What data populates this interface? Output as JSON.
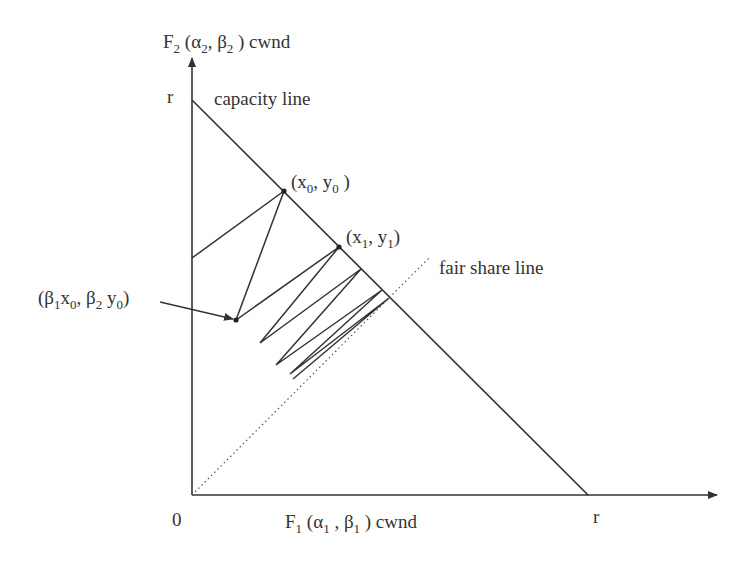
{
  "diagram": {
    "axes": {
      "y_label": {
        "F": "F",
        "f_sub": "2",
        "open": " (",
        "alpha": "α",
        "a_sub": "2",
        "comma": ", ",
        "beta": "β",
        "b_sub": "2",
        "close": " ) cwnd"
      },
      "x_label": {
        "F": "F",
        "f_sub": "1",
        "open": " (",
        "alpha": "α",
        "a_sub": "1",
        "comma": " , ",
        "beta": "β",
        "b_sub": "1",
        "close": " ) cwnd"
      },
      "origin_label": "0",
      "y_max_label": "r",
      "x_max_label": "r"
    },
    "lines": {
      "capacity": {
        "label": "capacity line"
      },
      "fair_share": {
        "label": "fair share line"
      }
    },
    "points": {
      "p0": {
        "open": "(x",
        "sub1": "0",
        "mid": ", y",
        "sub2": "0",
        "close": " )"
      },
      "p1": {
        "open": "(x",
        "sub1": "1",
        "mid": ", y",
        "sub2": "1",
        "close": ")"
      },
      "decrease": {
        "open": "(β",
        "s1": "1",
        "x": "x",
        "s2": "0",
        "comma": ", β",
        "s3": "2",
        "y": " y",
        "s4": "0",
        "close": ")"
      }
    },
    "colors": {
      "stroke": "#333333",
      "background": "#ffffff"
    }
  },
  "geometry": {
    "origin": [
      192,
      495
    ],
    "y_axis_top": [
      192,
      58
    ],
    "x_axis_end": [
      717,
      495
    ],
    "capacity_line": [
      [
        192,
        100
      ],
      [
        588,
        495
      ]
    ],
    "fair_share_line": [
      [
        192,
        495
      ],
      [
        430,
        257
      ]
    ],
    "trajectory": [
      [
        192,
        258
      ],
      [
        284,
        191
      ],
      [
        236,
        320
      ],
      [
        339,
        247
      ],
      [
        260,
        343
      ],
      [
        361,
        269
      ],
      [
        276,
        365
      ],
      [
        382,
        290
      ],
      [
        290,
        374
      ],
      [
        389,
        298
      ],
      [
        293,
        379
      ]
    ]
  }
}
